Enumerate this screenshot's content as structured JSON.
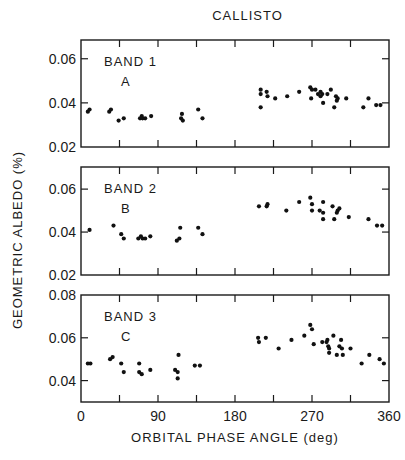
{
  "chart_data": {
    "type": "scatter",
    "title": "CALLISTO",
    "xlabel": "ORBITAL PHASE ANGLE (deg)",
    "ylabel": "GEOMETRIC ALBEDO (%)",
    "xlim": [
      0,
      360
    ],
    "x_ticks": [
      0,
      45,
      90,
      135,
      180,
      225,
      270,
      315,
      360
    ],
    "x_tick_labels": [
      "0",
      "90",
      "180",
      "270",
      "360"
    ],
    "grid": false,
    "legend": null,
    "panels": [
      {
        "label": "BAND 1",
        "sublabel": "A",
        "ylim": [
          0.02,
          0.0685
        ],
        "y_ticks": [
          0.02,
          0.04,
          0.06
        ],
        "y_tick_labels": [
          "0.02",
          "0.04",
          "0.06"
        ],
        "points": [
          [
            8,
            0.036
          ],
          [
            10,
            0.037
          ],
          [
            33,
            0.036
          ],
          [
            35,
            0.037
          ],
          [
            44,
            0.032
          ],
          [
            50,
            0.033
          ],
          [
            69,
            0.033
          ],
          [
            71,
            0.034
          ],
          [
            72,
            0.033
          ],
          [
            75,
            0.033
          ],
          [
            82,
            0.034
          ],
          [
            117,
            0.033
          ],
          [
            118,
            0.035
          ],
          [
            119,
            0.032
          ],
          [
            137,
            0.037
          ],
          [
            142,
            0.033
          ],
          [
            210,
            0.046
          ],
          [
            210,
            0.044
          ],
          [
            210,
            0.038
          ],
          [
            217,
            0.045
          ],
          [
            218,
            0.043
          ],
          [
            227,
            0.042
          ],
          [
            241,
            0.043
          ],
          [
            255,
            0.045
          ],
          [
            268,
            0.047
          ],
          [
            269,
            0.042
          ],
          [
            270,
            0.046
          ],
          [
            274,
            0.046
          ],
          [
            277,
            0.044
          ],
          [
            280,
            0.045
          ],
          [
            280,
            0.043
          ],
          [
            282,
            0.044
          ],
          [
            283,
            0.04
          ],
          [
            288,
            0.044
          ],
          [
            292,
            0.046
          ],
          [
            296,
            0.038
          ],
          [
            298,
            0.043
          ],
          [
            299,
            0.041
          ],
          [
            300,
            0.042
          ],
          [
            310,
            0.042
          ],
          [
            330,
            0.038
          ],
          [
            336,
            0.042
          ],
          [
            345,
            0.039
          ],
          [
            350,
            0.039
          ]
        ]
      },
      {
        "label": "BAND 2",
        "sublabel": "B",
        "ylim": [
          0.02,
          0.0703
        ],
        "y_ticks": [
          0.02,
          0.04,
          0.06
        ],
        "y_tick_labels": [
          "0.02",
          "0.04",
          "0.06"
        ],
        "points": [
          [
            10,
            0.041
          ],
          [
            38,
            0.043
          ],
          [
            47,
            0.039
          ],
          [
            50,
            0.037
          ],
          [
            67,
            0.037
          ],
          [
            70,
            0.038
          ],
          [
            72,
            0.037
          ],
          [
            75,
            0.037
          ],
          [
            81,
            0.038
          ],
          [
            112,
            0.036
          ],
          [
            115,
            0.037
          ],
          [
            116,
            0.042
          ],
          [
            137,
            0.042
          ],
          [
            142,
            0.039
          ],
          [
            208,
            0.052
          ],
          [
            217,
            0.052
          ],
          [
            218,
            0.053
          ],
          [
            240,
            0.05
          ],
          [
            255,
            0.054
          ],
          [
            268,
            0.056
          ],
          [
            270,
            0.053
          ],
          [
            270,
            0.05
          ],
          [
            279,
            0.05
          ],
          [
            283,
            0.054
          ],
          [
            283,
            0.049
          ],
          [
            283,
            0.046
          ],
          [
            294,
            0.052
          ],
          [
            296,
            0.046
          ],
          [
            299,
            0.049
          ],
          [
            300,
            0.05
          ],
          [
            302,
            0.051
          ],
          [
            313,
            0.047
          ],
          [
            336,
            0.046
          ],
          [
            346,
            0.043
          ],
          [
            352,
            0.043
          ]
        ]
      },
      {
        "label": "BAND 3",
        "sublabel": "C",
        "ylim": [
          0.03,
          0.08
        ],
        "y_ticks": [
          0.04,
          0.06,
          0.08
        ],
        "y_tick_labels": [
          "0.04",
          "0.06",
          "0.08"
        ],
        "points": [
          [
            8,
            0.048
          ],
          [
            11,
            0.048
          ],
          [
            34,
            0.05
          ],
          [
            37,
            0.051
          ],
          [
            47,
            0.048
          ],
          [
            50,
            0.044
          ],
          [
            68,
            0.048
          ],
          [
            68,
            0.044
          ],
          [
            71,
            0.043
          ],
          [
            81,
            0.045
          ],
          [
            110,
            0.045
          ],
          [
            113,
            0.044
          ],
          [
            114,
            0.052
          ],
          [
            113,
            0.041
          ],
          [
            133,
            0.047
          ],
          [
            139,
            0.047
          ],
          [
            207,
            0.06
          ],
          [
            208,
            0.058
          ],
          [
            216,
            0.06
          ],
          [
            231,
            0.055
          ],
          [
            246,
            0.059
          ],
          [
            261,
            0.061
          ],
          [
            268,
            0.066
          ],
          [
            270,
            0.064
          ],
          [
            272,
            0.057
          ],
          [
            282,
            0.058
          ],
          [
            287,
            0.058
          ],
          [
            288,
            0.059
          ],
          [
            289,
            0.056
          ],
          [
            290,
            0.055
          ],
          [
            290,
            0.053
          ],
          [
            295,
            0.061
          ],
          [
            299,
            0.052
          ],
          [
            302,
            0.056
          ],
          [
            304,
            0.059
          ],
          [
            305,
            0.055
          ],
          [
            306,
            0.052
          ],
          [
            315,
            0.055
          ],
          [
            328,
            0.048
          ],
          [
            337,
            0.052
          ],
          [
            349,
            0.05
          ],
          [
            354,
            0.048
          ]
        ]
      }
    ]
  }
}
